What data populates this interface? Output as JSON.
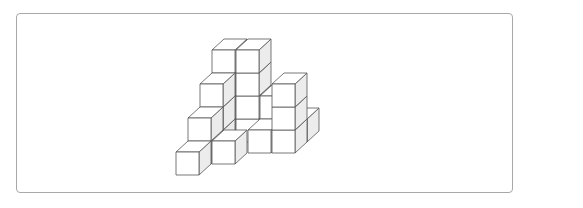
{
  "figure": {
    "cube_count": 21,
    "colors": {
      "face_top": "#ffffff",
      "face_front": "#ffffff",
      "face_side": "#ececec",
      "edge": "#555555",
      "frame": "#a8a8a8"
    },
    "geometry": {
      "origin_x": 176,
      "origin_y": 175,
      "unit": 23,
      "depth_dx": 12,
      "depth_dy": -11
    },
    "cubes": [
      {
        "x": 0,
        "y": 0,
        "z": 0
      },
      {
        "x": 0,
        "y": 0,
        "z": 1
      },
      {
        "x": 0,
        "y": 1,
        "z": 1
      },
      {
        "x": 0,
        "y": 0,
        "z": 2
      },
      {
        "x": 0,
        "y": 1,
        "z": 2
      },
      {
        "x": 0,
        "y": 2,
        "z": 2
      },
      {
        "x": 0,
        "y": 0,
        "z": 3
      },
      {
        "x": 0,
        "y": 1,
        "z": 3
      },
      {
        "x": 0,
        "y": 2,
        "z": 3
      },
      {
        "x": 0,
        "y": 3,
        "z": 3
      },
      {
        "x": 1,
        "y": 0,
        "z": 3
      },
      {
        "x": 1,
        "y": 1,
        "z": 3
      },
      {
        "x": 1,
        "y": 2,
        "z": 3
      },
      {
        "x": 1,
        "y": 3,
        "z": 3
      },
      {
        "x": 2,
        "y": 0,
        "z": 3
      },
      {
        "x": 2,
        "y": 1,
        "z": 3
      },
      {
        "x": 3,
        "y": 0,
        "z": 3
      },
      {
        "x": 1,
        "y": 0,
        "z": 1
      },
      {
        "x": 2,
        "y": 0,
        "z": 2
      },
      {
        "x": 3,
        "y": 0,
        "z": 2
      },
      {
        "x": 3,
        "y": 1,
        "z": 2
      },
      {
        "x": 3,
        "y": 2,
        "z": 2
      }
    ]
  }
}
